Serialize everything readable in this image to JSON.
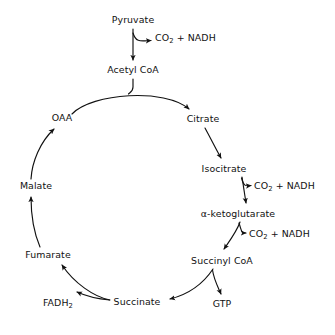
{
  "diagram": {
    "background_color": "#ffffff",
    "stroke_color": "#111111",
    "text_color": "#111111",
    "nodes": [
      {
        "id": "pyruvate",
        "label": "Pyruvate",
        "x": 133,
        "y": 20,
        "align": "center"
      },
      {
        "id": "co2_nadh_1",
        "label": "CO2 + NADH",
        "html": "CO<sub>2</sub> + NADH",
        "x": 155,
        "y": 38,
        "align": "left"
      },
      {
        "id": "acetyl_coa",
        "label": "Acetyl CoA",
        "x": 133,
        "y": 70,
        "align": "center"
      },
      {
        "id": "oaa",
        "label": "OAA",
        "x": 62,
        "y": 118,
        "align": "center"
      },
      {
        "id": "citrate",
        "label": "Citrate",
        "x": 203,
        "y": 119,
        "align": "center"
      },
      {
        "id": "isocitrate",
        "label": "Isocitrate",
        "x": 224,
        "y": 169,
        "align": "center"
      },
      {
        "id": "co2_nadh_2",
        "label": "CO2 + NADH",
        "html": "CO<sub>2</sub> + NADH",
        "x": 254,
        "y": 186,
        "align": "left"
      },
      {
        "id": "alpha_kg",
        "label": "α-ketoglutarate",
        "x": 238,
        "y": 214,
        "align": "center"
      },
      {
        "id": "co2_nadh_3",
        "label": "CO2 + NADH",
        "html": "CO<sub>2</sub> + NADH",
        "x": 249,
        "y": 234,
        "align": "left"
      },
      {
        "id": "succinyl_coa",
        "label": "Succinyl CoA",
        "x": 222,
        "y": 261,
        "align": "center"
      },
      {
        "id": "gtp",
        "label": "GTP",
        "x": 222,
        "y": 304,
        "align": "center"
      },
      {
        "id": "succinate",
        "label": "Succinate",
        "x": 137,
        "y": 302,
        "align": "center"
      },
      {
        "id": "fadh2",
        "label": "FADH2",
        "html": "FADH<sub>2</sub>",
        "x": 58,
        "y": 303,
        "align": "center"
      },
      {
        "id": "fumarate",
        "label": "Fumarate",
        "x": 48,
        "y": 255,
        "align": "center"
      },
      {
        "id": "malate",
        "label": "Malate",
        "x": 36,
        "y": 186,
        "align": "center"
      }
    ],
    "edges": [
      {
        "id": "pyruvate-to-acetyl-coa",
        "from": "pyruvate",
        "to": "acetyl_coa",
        "kind": "straight-down"
      },
      {
        "id": "pyruvate-to-co2-nadh",
        "from": "pyruvate",
        "to": "co2_nadh_1",
        "kind": "branch"
      },
      {
        "id": "acetyl-coa-to-cycle",
        "from": "acetyl_coa",
        "to": "cycle",
        "kind": "feed-in"
      },
      {
        "id": "oaa-to-citrate",
        "from": "oaa",
        "to": "citrate",
        "kind": "arc"
      },
      {
        "id": "citrate-to-isocitrate",
        "from": "citrate",
        "to": "isocitrate",
        "kind": "arc"
      },
      {
        "id": "isocitrate-to-alpha-kg",
        "from": "isocitrate",
        "to": "alpha_kg",
        "kind": "straight-down"
      },
      {
        "id": "isocitrate-to-co2-nadh",
        "from": "isocitrate",
        "to": "co2_nadh_2",
        "kind": "branch"
      },
      {
        "id": "alpha-kg-to-succinyl-coa",
        "from": "alpha_kg",
        "to": "succinyl_coa",
        "kind": "arc"
      },
      {
        "id": "alpha-kg-to-co2-nadh",
        "from": "alpha_kg",
        "to": "co2_nadh_3",
        "kind": "branch"
      },
      {
        "id": "succinyl-coa-to-succinate",
        "from": "succinyl_coa",
        "to": "succinate",
        "kind": "arc"
      },
      {
        "id": "succinyl-coa-to-gtp",
        "from": "succinyl_coa",
        "to": "gtp",
        "kind": "branch"
      },
      {
        "id": "succinate-to-fumarate",
        "from": "succinate",
        "to": "fumarate",
        "kind": "arc"
      },
      {
        "id": "succinate-to-fadh2",
        "from": "succinate",
        "to": "fadh2",
        "kind": "branch"
      },
      {
        "id": "fumarate-to-malate",
        "from": "fumarate",
        "to": "malate",
        "kind": "arc"
      },
      {
        "id": "malate-to-oaa",
        "from": "malate",
        "to": "oaa",
        "kind": "arc"
      }
    ]
  }
}
